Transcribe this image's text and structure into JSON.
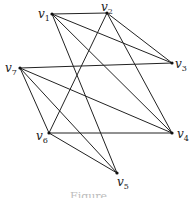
{
  "graph": {
    "nodes": [
      {
        "id": "v1",
        "name": "v",
        "sub": "1",
        "x": 52,
        "y": 14,
        "lx": 38,
        "ly": 18
      },
      {
        "id": "v2",
        "name": "v",
        "sub": "2",
        "x": 107,
        "y": 13,
        "lx": 101,
        "ly": 11
      },
      {
        "id": "v3",
        "name": "v",
        "sub": "3",
        "x": 172,
        "y": 63,
        "lx": 175,
        "ly": 68
      },
      {
        "id": "v4",
        "name": "v",
        "sub": "4",
        "x": 172,
        "y": 133,
        "lx": 177,
        "ly": 138
      },
      {
        "id": "v5",
        "name": "v",
        "sub": "5",
        "x": 117,
        "y": 173,
        "lx": 117,
        "ly": 186
      },
      {
        "id": "v6",
        "name": "v",
        "sub": "6",
        "x": 49,
        "y": 133,
        "lx": 36,
        "ly": 140
      },
      {
        "id": "v7",
        "name": "v",
        "sub": "7",
        "x": 20,
        "y": 68,
        "lx": 5,
        "ly": 72
      }
    ],
    "edges": [
      [
        "v1",
        "v2"
      ],
      [
        "v1",
        "v3"
      ],
      [
        "v1",
        "v4"
      ],
      [
        "v1",
        "v5"
      ],
      [
        "v2",
        "v3"
      ],
      [
        "v2",
        "v4"
      ],
      [
        "v2",
        "v6"
      ],
      [
        "v7",
        "v3"
      ],
      [
        "v7",
        "v4"
      ],
      [
        "v7",
        "v5"
      ],
      [
        "v7",
        "v6"
      ],
      [
        "v6",
        "v4"
      ],
      [
        "v6",
        "v5"
      ]
    ]
  },
  "caption": "Figure"
}
